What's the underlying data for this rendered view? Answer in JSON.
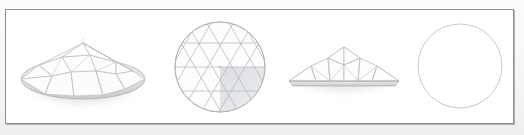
{
  "window": {
    "title": "Geodesic Dome - Multi-View Drawing",
    "background_color": "#f4f4f4"
  },
  "panel": {
    "name": "drawing-viewport",
    "background_color": "#ffffff",
    "border_color": "#8e9196",
    "border_width_px": 1,
    "x": 5,
    "y": 9,
    "width": 509,
    "height": 115
  },
  "style": {
    "edge_color": "#b9bcc0",
    "edge_color_strong": "#9a9da2",
    "face_fill": "#fdfdfd",
    "face_fill_shaded": "#e6e7e9",
    "shadow_color": "rgba(140,142,146,0.45)",
    "outline_color": "#c4c7cb"
  },
  "views": [
    {
      "id": "view-perspective",
      "name": "perspective-dome-view",
      "label": "Perspective",
      "projection": "isometric",
      "shape": "geodesic-dome",
      "x": 10,
      "y": 9,
      "width": 145,
      "height": 115,
      "frequency": 2,
      "segments": 8
    },
    {
      "id": "view-top",
      "name": "top-plan-dome-view",
      "label": "Top",
      "projection": "plan",
      "shape": "geodesic-dome-triangulated-circle",
      "x": 160,
      "y": 9,
      "width": 115,
      "height": 115,
      "frequency": 2,
      "segments": 8
    },
    {
      "id": "view-front",
      "name": "front-elevation-dome-view",
      "label": "Front",
      "projection": "elevation",
      "shape": "geodesic-dome-profile",
      "x": 282,
      "y": 9,
      "width": 120,
      "height": 115,
      "frequency": 2,
      "segments": 8
    },
    {
      "id": "view-outline",
      "name": "plan-outline-circle-view",
      "label": "Outline",
      "projection": "plan",
      "shape": "circle",
      "x": 405,
      "y": 9,
      "width": 110,
      "height": 115,
      "radius": 42
    }
  ]
}
